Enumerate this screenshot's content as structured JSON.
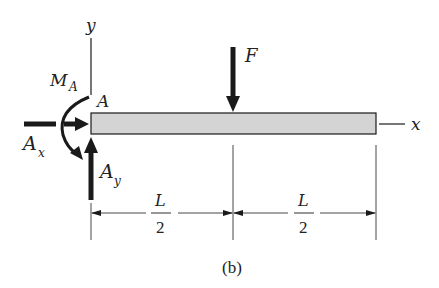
{
  "figure": {
    "caption": "(b)",
    "type": "free-body-diagram",
    "colors": {
      "beam_fill": "#d4d4d4",
      "stroke": "#1a1a1a",
      "text": "#222222"
    }
  },
  "axes": {
    "y_label": "y",
    "x_label": "x"
  },
  "point": {
    "label": "A"
  },
  "forces": {
    "moment": {
      "label": "M",
      "subscript": "A"
    },
    "horizontal_reaction": {
      "label": "A",
      "subscript": "x"
    },
    "vertical_reaction": {
      "label": "A",
      "subscript": "y"
    },
    "applied_load": {
      "label": "F"
    }
  },
  "dimensions": [
    {
      "numerator": "L",
      "denominator": "2"
    },
    {
      "numerator": "L",
      "denominator": "2"
    }
  ]
}
